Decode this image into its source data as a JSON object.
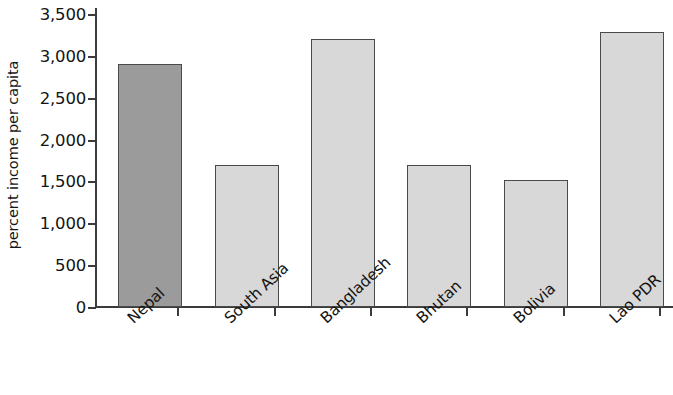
{
  "chart_data": {
    "type": "bar",
    "title": "",
    "subtitle": "",
    "xlabel": "",
    "ylabel": "percent income per capita",
    "categories": [
      "Nepal",
      "South Asia",
      "Bangladesh",
      "Bhutan",
      "Bolivia",
      "Lao PDR"
    ],
    "values": [
      2900,
      1700,
      3200,
      1700,
      1520,
      3280
    ],
    "ylim": [
      0,
      3500
    ],
    "ytick_values": [
      0,
      500,
      1000,
      1500,
      2000,
      2500,
      3000,
      3500
    ],
    "ytick_labels": [
      "0",
      "500",
      "1,000",
      "1,500",
      "2,000",
      "2,500",
      "3,000",
      "3,500"
    ],
    "grid": false,
    "legend": null,
    "bar_colors": [
      "#9b9b9b",
      "#d8d8d8",
      "#d8d8d8",
      "#d8d8d8",
      "#d8d8d8",
      "#d8d8d8"
    ],
    "bar_border_color": "#4a4a4a",
    "highlight_category": "Nepal",
    "axis_color": "#3b3b3b",
    "background_color": "#ffffff"
  }
}
